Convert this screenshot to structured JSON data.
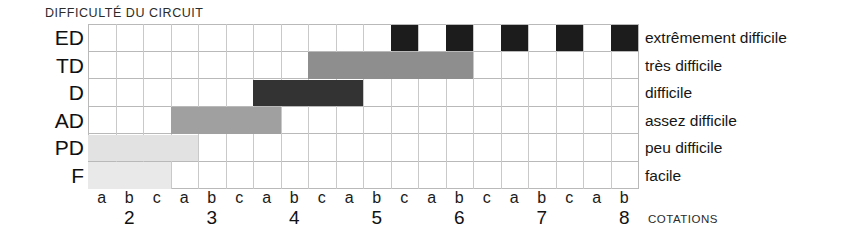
{
  "chart_title": "DIFFICULTÉ DU CIRCUIT",
  "axis_title": "COTATIONS",
  "rows": [
    {
      "code": "ED",
      "legend": "extrêmement difficile"
    },
    {
      "code": "TD",
      "legend": "très difficile"
    },
    {
      "code": "D",
      "legend": "difficile"
    },
    {
      "code": "AD",
      "legend": "assez difficile"
    },
    {
      "code": "PD",
      "legend": "peu difficile"
    },
    {
      "code": "F",
      "legend": "facile"
    }
  ],
  "x_letters": [
    "a",
    "b",
    "c",
    "a",
    "b",
    "c",
    "a",
    "b",
    "c",
    "a",
    "b",
    "c",
    "a",
    "b",
    "c",
    "a",
    "b",
    "c",
    "a",
    "b"
  ],
  "x_numbers": [
    {
      "label": "2",
      "col": 2
    },
    {
      "label": "3",
      "col": 5
    },
    {
      "label": "4",
      "col": 8
    },
    {
      "label": "5",
      "col": 11
    },
    {
      "label": "6",
      "col": 14
    },
    {
      "label": "7",
      "col": 17
    },
    {
      "label": "8",
      "col": 20
    }
  ],
  "colors": {
    "extremement_difficile": "#1c1c1c",
    "tres_difficile": "#8e8e8e",
    "difficile": "#333333",
    "assez_difficile": "#a0a0a0",
    "peu_difficile": "#e2e2e2",
    "facile": "#e9e9e9",
    "grid_line": "#c9c9c9",
    "grid_border": "#b9b9b9"
  },
  "chart_data": {
    "type": "bar",
    "title": "DIFFICULTÉ DU CIRCUIT",
    "xlabel": "COTATIONS",
    "ylabel": "",
    "orientation": "horizontal",
    "grid": true,
    "legend_position": "right",
    "categories": [
      "ED",
      "TD",
      "D",
      "AD",
      "PD",
      "F"
    ],
    "category_labels": [
      "extrêmement difficile",
      "très difficile",
      "difficile",
      "assez difficile",
      "peu difficile",
      "facile"
    ],
    "x_tick_labels": [
      "a",
      "b",
      "c",
      "a",
      "b",
      "c",
      "a",
      "b",
      "c",
      "a",
      "b",
      "c",
      "a",
      "b",
      "c",
      "a",
      "b",
      "c",
      "a",
      "b"
    ],
    "x_group_labels": [
      "2",
      "3",
      "4",
      "5",
      "6",
      "7",
      "8"
    ],
    "xlim": [
      1,
      20
    ],
    "series": [
      {
        "name": "ED",
        "legend": "extrêmement difficile",
        "color": "#1c1c1c",
        "kind": "cells",
        "cells": [
          12,
          14,
          16,
          18,
          20
        ],
        "cotations": [
          "5c",
          "6b",
          "6c+",
          "7b",
          "7c+"
        ]
      },
      {
        "name": "TD",
        "legend": "très difficile",
        "color": "#8e8e8e",
        "kind": "span",
        "start": 9,
        "end": 14,
        "cotations": [
          "4c",
          "6b"
        ]
      },
      {
        "name": "D",
        "legend": "difficile",
        "color": "#333333",
        "kind": "span",
        "start": 7,
        "end": 10,
        "cotations": [
          "4a",
          "5a"
        ]
      },
      {
        "name": "AD",
        "legend": "assez difficile",
        "color": "#a0a0a0",
        "kind": "span",
        "start": 4,
        "end": 7,
        "cotations": [
          "3a",
          "4a"
        ]
      },
      {
        "name": "PD",
        "legend": "peu difficile",
        "color": "#e2e2e2",
        "kind": "span",
        "start": 1,
        "end": 4,
        "cotations": [
          "2a",
          "3a"
        ]
      },
      {
        "name": "F",
        "legend": "facile",
        "color": "#e9e9e9",
        "kind": "span",
        "start": 1,
        "end": 3,
        "cotations": [
          "2a",
          "2c"
        ]
      }
    ]
  }
}
